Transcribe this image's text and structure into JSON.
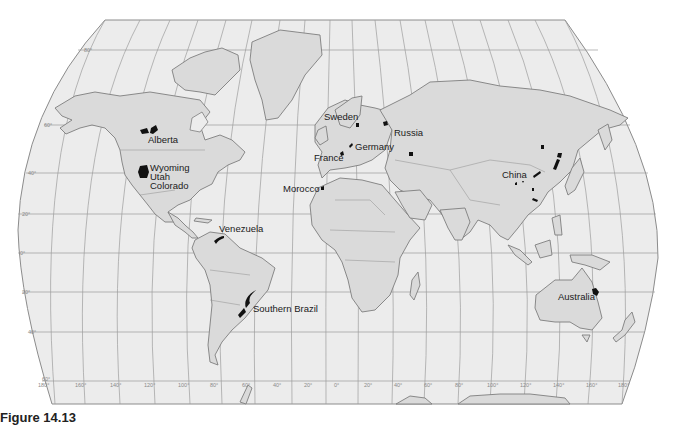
{
  "map": {
    "title": "World map of oil shale / phosphate deposit regions",
    "colors": {
      "ocean": "#ececec",
      "land": "#dadada",
      "outline": "#7e7e7e",
      "grid": "#9c9c9c",
      "deposit": "#111111"
    },
    "labels": [
      {
        "id": "alberta",
        "text": "Alberta"
      },
      {
        "id": "wyoming",
        "text": "Wyoming"
      },
      {
        "id": "utah",
        "text": "Utah"
      },
      {
        "id": "colorado",
        "text": "Colorado"
      },
      {
        "id": "venezuela",
        "text": "Venezuela"
      },
      {
        "id": "southern-brazil",
        "text": "Southern Brazil"
      },
      {
        "id": "morocco",
        "text": "Morocco"
      },
      {
        "id": "france",
        "text": "France"
      },
      {
        "id": "germany",
        "text": "Germany"
      },
      {
        "id": "sweden",
        "text": "Sweden"
      },
      {
        "id": "russia",
        "text": "Russia"
      },
      {
        "id": "china",
        "text": "China"
      },
      {
        "id": "australia",
        "text": "Australia"
      }
    ],
    "latitude_ticks": [
      "80°",
      "60°",
      "40°",
      "20°",
      "0°",
      "20°",
      "40°",
      "60°"
    ],
    "longitude_ticks": [
      "180°",
      "160°",
      "140°",
      "120°",
      "100°",
      "80°",
      "60°",
      "40°",
      "20°",
      "0°",
      "20°",
      "40°",
      "60°",
      "80°",
      "100°",
      "120°",
      "140°",
      "160°",
      "180°"
    ]
  },
  "caption": {
    "text": "Figure 14.13"
  }
}
